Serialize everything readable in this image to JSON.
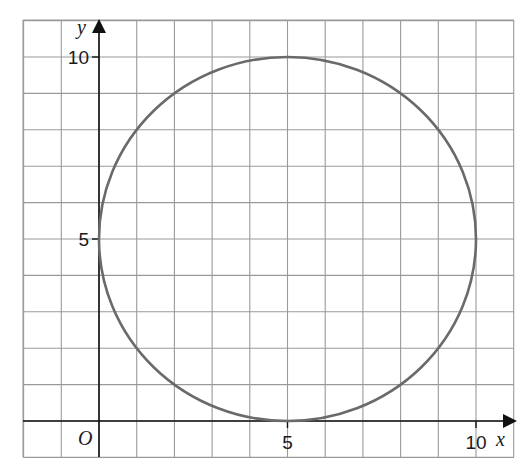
{
  "chart_data": {
    "type": "line",
    "title": "",
    "xlabel": "x",
    "ylabel": "y",
    "origin_label": "O",
    "xlim": [
      -2,
      11
    ],
    "ylim": [
      -1,
      11
    ],
    "grid": true,
    "grid_step": 1,
    "x_ticks": [
      {
        "value": 5,
        "label": "5"
      },
      {
        "value": 10,
        "label": "10"
      }
    ],
    "y_ticks": [
      {
        "value": 5,
        "label": "5"
      },
      {
        "value": 10,
        "label": "10"
      }
    ],
    "series": [
      {
        "name": "circle",
        "shape": "circle",
        "center": [
          5,
          5
        ],
        "radius": 5,
        "equation": "(x-5)^2 + (y-5)^2 = 25",
        "key_points": [
          [
            0,
            5
          ],
          [
            5,
            10
          ],
          [
            10,
            5
          ],
          [
            5,
            0
          ]
        ]
      }
    ],
    "legend": null
  },
  "colors": {
    "grid": "#9a9a9a",
    "axes": "#111111",
    "curve": "#6a6a6a",
    "background": "#ffffff"
  }
}
